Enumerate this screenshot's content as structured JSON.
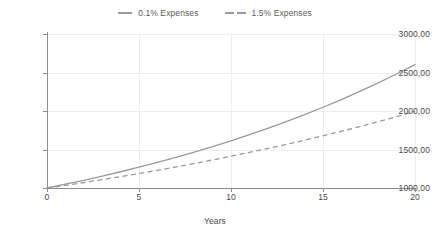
{
  "legend": {
    "position": "top-center",
    "entries": [
      {
        "label": "0.1% Expenses",
        "style": "solid",
        "color": "#9a9a9a"
      },
      {
        "label": "1.5% Expenses",
        "style": "dashed",
        "color": "#9a9a9a"
      }
    ]
  },
  "axes": {
    "x_title": "Years",
    "y_title": "",
    "x_ticks": [
      "0",
      "5",
      "10",
      "15",
      "20"
    ],
    "y_ticks": [
      "1000,00",
      "1500,00",
      "2000,00",
      "2500,00",
      "3000,00"
    ]
  },
  "chart_data": {
    "type": "line",
    "title": "",
    "subtitle": "",
    "xlabel": "Years",
    "ylabel": "",
    "xlim": [
      0,
      20
    ],
    "ylim": [
      1000,
      3000
    ],
    "xticks": [
      0,
      5,
      10,
      15,
      20
    ],
    "yticks": [
      1000,
      1500,
      2000,
      2500,
      3000
    ],
    "xticklabels": [
      "0",
      "5",
      "10",
      "15",
      "20"
    ],
    "yticklabels": [
      "1000,00",
      "1500,00",
      "2000,00",
      "2500,00",
      "3000,00"
    ],
    "grid": true,
    "legend_position": "top-center",
    "x": [
      0,
      1,
      2,
      3,
      4,
      5,
      6,
      7,
      8,
      9,
      10,
      11,
      12,
      13,
      14,
      15,
      16,
      17,
      18,
      19,
      20
    ],
    "series": [
      {
        "name": "0.1% Expenses",
        "style": "solid",
        "color": "#9a9a9a",
        "values": [
          1000,
          1049,
          1100,
          1154,
          1211,
          1270,
          1332,
          1397,
          1466,
          1538,
          1613,
          1692,
          1775,
          1862,
          1953,
          2049,
          2149,
          2255,
          2365,
          2481,
          2603
        ]
      },
      {
        "name": "1.5% Expenses",
        "style": "dashed",
        "color": "#9a9a9a",
        "values": [
          1000,
          1035,
          1071,
          1109,
          1148,
          1188,
          1230,
          1273,
          1318,
          1364,
          1412,
          1462,
          1513,
          1566,
          1621,
          1678,
          1737,
          1798,
          1861,
          1927,
          1994
        ]
      }
    ]
  }
}
